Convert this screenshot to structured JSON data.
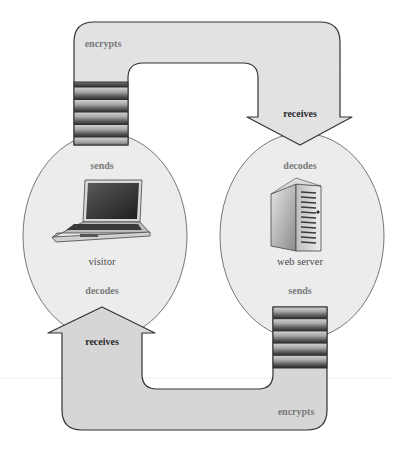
{
  "diagram": {
    "title": "",
    "colors": {
      "background": "#ffffff",
      "pipe_fill": "#dcdcdc",
      "pipe_fill_top": "#e4e4e4",
      "ellipse_fill": "#ececec",
      "outline": "#333333",
      "ellipse_outline": "#777777",
      "stripe_dark": "#3a3a3a",
      "stripe_light": "#b8b8b8",
      "label_gray": "#7a7a7a",
      "label_dark": "#2a2a2a"
    },
    "nodes": {
      "visitor": {
        "label": "visitor",
        "icon": "laptop-icon",
        "top_label": "sends",
        "bottom_label": "decodes"
      },
      "server": {
        "label": "web server",
        "icon": "server-tower-icon",
        "top_label": "decodes",
        "bottom_label": "sends"
      }
    },
    "flows": {
      "top": {
        "from": "visitor",
        "to": "server",
        "pipe_label": "encrypts",
        "arrow_label": "receives"
      },
      "bottom": {
        "from": "server",
        "to": "visitor",
        "pipe_label": "encrypts",
        "arrow_label": "receives"
      }
    }
  }
}
